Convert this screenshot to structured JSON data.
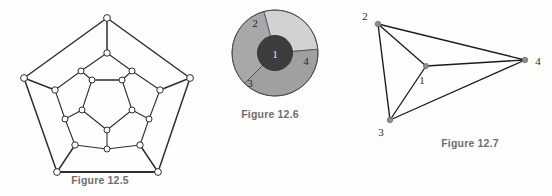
{
  "page": {
    "width": 552,
    "height": 196,
    "background": "#fefefe",
    "kind": "textbook-figure-sheet"
  },
  "captions": {
    "fig_12_5": "Figure 12.5",
    "fig_12_6": "Figure 12.6",
    "fig_12_7": "Figure 12.7"
  },
  "colors": {
    "edge": "#2e2e2e",
    "node_fill": "#ffffff",
    "node_stroke": "#2e2e2e",
    "caption_text": "#6e6e6e",
    "region_1": "#3d3d3d",
    "region_2": "#d2d2d2",
    "region_3": "#a8a8a8",
    "region_4": "#a0a0a0",
    "region_border": "#4a4a4a",
    "dual_node": "#8c8c8c",
    "dual_edge": "#1c1c1c",
    "label_dark": "#1e1e1e",
    "label_light": "#e8e8e8"
  },
  "figure_12_5": {
    "title": "Figure 12.5",
    "graph_name": "dodecahedral-graph",
    "vertex_count": 20,
    "edge_count": 30,
    "layout": "three concentric pentagons plus outer spokes",
    "outer_pentagon": [
      {
        "id": "o1",
        "x": 107,
        "y": 18
      },
      {
        "id": "o2",
        "x": 190,
        "y": 78
      },
      {
        "id": "o3",
        "x": 158,
        "y": 172
      },
      {
        "id": "o4",
        "x": 57,
        "y": 172
      },
      {
        "id": "o5",
        "x": 24,
        "y": 78
      }
    ],
    "middle_pentagon": [
      {
        "id": "m1",
        "x": 107,
        "y": 53
      },
      {
        "id": "m2",
        "x": 160,
        "y": 90
      },
      {
        "id": "m3",
        "x": 140,
        "y": 145
      },
      {
        "id": "m4",
        "x": 75,
        "y": 145
      },
      {
        "id": "m5",
        "x": 55,
        "y": 90
      }
    ],
    "pentagram_outer": [
      {
        "id": "p1",
        "x": 81,
        "y": 71
      },
      {
        "id": "p2",
        "x": 132,
        "y": 71
      },
      {
        "id": "p3",
        "x": 149,
        "y": 119
      },
      {
        "id": "p4",
        "x": 107,
        "y": 149
      },
      {
        "id": "p5",
        "x": 65,
        "y": 119
      }
    ],
    "inner_pentagon": [
      {
        "id": "i1",
        "x": 92,
        "y": 80
      },
      {
        "id": "i2",
        "x": 122,
        "y": 80
      },
      {
        "id": "i3",
        "x": 132,
        "y": 110
      },
      {
        "id": "i4",
        "x": 107,
        "y": 130
      },
      {
        "id": "i5",
        "x": 82,
        "y": 110
      }
    ],
    "node_radius": 3.1
  },
  "figure_12_6": {
    "title": "Figure 12.6",
    "kind": "region-map",
    "shape": "circle divided into a central disc and three outer sectors",
    "center": {
      "x": 75,
      "y": 53
    },
    "outer_radius": 43,
    "inner_radius": 17.5,
    "regions": [
      {
        "label": "1",
        "role": "central disc",
        "fill": "#3d3d3d",
        "label_x": 75,
        "label_y": 57,
        "label_color": "light"
      },
      {
        "label": "2",
        "role": "upper-left sector",
        "fill": "#d2d2d2",
        "label_x": 55,
        "label_y": 24,
        "label_color": "dark",
        "start_angle": -105,
        "end_angle": -5
      },
      {
        "label": "3",
        "role": "lower-left sector",
        "fill": "#a8a8a8",
        "label_x": 50,
        "label_y": 84,
        "label_color": "dark",
        "start_angle": 135,
        "end_angle": 255
      },
      {
        "label": "4",
        "role": "right sector",
        "fill": "#a0a0a0",
        "label_x": 106,
        "label_y": 62,
        "label_color": "dark",
        "start_angle": -5,
        "end_angle": 135
      }
    ]
  },
  "figure_12_7": {
    "title": "Figure 12.7",
    "graph_name": "dual-graph-K4",
    "vertex_count": 4,
    "edge_count": 6,
    "vertices": [
      {
        "label": "1",
        "x": 86,
        "y": 66,
        "label_x": 82,
        "label_y": 82
      },
      {
        "label": "2",
        "x": 38,
        "y": 24,
        "label_x": 26,
        "label_y": 18
      },
      {
        "label": "3",
        "x": 50,
        "y": 120,
        "label_x": 42,
        "label_y": 134
      },
      {
        "label": "4",
        "x": 185,
        "y": 60,
        "label_x": 196,
        "label_y": 66
      }
    ],
    "edges": [
      {
        "from": "1",
        "to": "2"
      },
      {
        "from": "1",
        "to": "3"
      },
      {
        "from": "1",
        "to": "4"
      },
      {
        "from": "2",
        "to": "3"
      },
      {
        "from": "2",
        "to": "4"
      },
      {
        "from": "3",
        "to": "4"
      }
    ],
    "node_radius": 2.6
  }
}
